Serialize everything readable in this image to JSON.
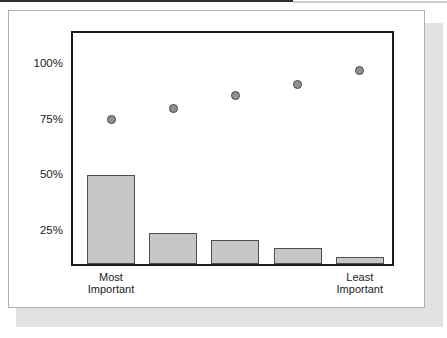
{
  "chart_data": {
    "type": "bar",
    "categories": [
      "Most Important",
      "",
      "",
      "",
      "Least Important"
    ],
    "series": [
      {
        "name": "bars",
        "type": "bar",
        "values": [
          50,
          24,
          21,
          17,
          13
        ]
      },
      {
        "name": "dots",
        "type": "scatter",
        "values": [
          75,
          80,
          86,
          91,
          97
        ]
      }
    ],
    "y_ticks": [
      {
        "value": 100,
        "label": "100%"
      },
      {
        "value": 75,
        "label": "75%"
      },
      {
        "value": 50,
        "label": "50%"
      },
      {
        "value": 25,
        "label": "25%"
      }
    ],
    "x_tick_labels": [
      {
        "index": 0,
        "lines": [
          "Most",
          "Important"
        ]
      },
      {
        "index": 4,
        "lines": [
          "Least",
          "Important"
        ]
      }
    ],
    "title": "",
    "xlabel": "",
    "ylabel": "",
    "ylim": [
      10,
      114
    ],
    "grid": false,
    "legend": false
  },
  "colors": {
    "bar_fill": "#c7c7c7",
    "bar_border": "#4f4f4f",
    "dot_fill": "#909090",
    "dot_border": "#474747",
    "plot_border": "#1c1c1c",
    "card_border": "#b0b0b0",
    "card_bg": "#ffffff",
    "shadow": "#e2e2e2",
    "text": "#1a1a1a",
    "top_line_dark": "#2e2e2e",
    "top_line_light": "#cccccc"
  }
}
